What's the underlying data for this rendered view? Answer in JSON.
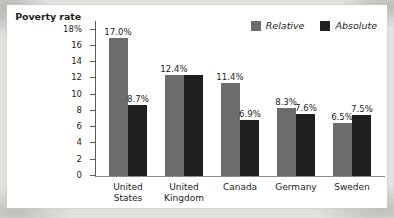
{
  "axis_title": {
    "line1": "Poverty",
    "line2": "rate"
  },
  "legend": {
    "relative": {
      "label": "Relative",
      "color": "#6c6c6c",
      "swatch": "relative-swatch"
    },
    "absolute": {
      "label": "Absolute",
      "color": "#1f1f1f",
      "swatch": "absolute-swatch"
    }
  },
  "y_ticks": [
    "18%",
    "16",
    "14",
    "12",
    "10",
    "8",
    "6",
    "4",
    "2",
    "0"
  ],
  "labels": {
    "us": {
      "relative": "17.0%",
      "absolute": "8.7%",
      "l1": "United",
      "l2": "States"
    },
    "uk": {
      "relative": "12.4%",
      "absolute": "",
      "l1": "United",
      "l2": "Kingdom"
    },
    "canada": {
      "relative": "11.4%",
      "absolute": "6.9%",
      "l1": "Canada",
      "l2": ""
    },
    "germany": {
      "relative": "8.3%",
      "absolute": "7.6%",
      "l1": "Germany",
      "l2": ""
    },
    "sweden": {
      "relative": "6.5%",
      "absolute": "7.5%",
      "l1": "Sweden",
      "l2": ""
    }
  },
  "chart_data": {
    "type": "bar",
    "title": "",
    "xlabel": "",
    "ylabel": "Poverty rate",
    "ylim": [
      0,
      18
    ],
    "ytick_values": [
      0,
      2,
      4,
      6,
      8,
      10,
      12,
      14,
      16,
      18
    ],
    "ytick_labels": [
      "0",
      "2",
      "4",
      "6",
      "8",
      "10",
      "12",
      "14",
      "16",
      "18%"
    ],
    "grid": false,
    "legend_position": "top-right",
    "categories": [
      "United States",
      "United Kingdom",
      "Canada",
      "Germany",
      "Sweden"
    ],
    "series": [
      {
        "name": "Relative",
        "color": "#6c6c6c",
        "values": [
          17.0,
          12.4,
          11.4,
          8.3,
          6.5
        ]
      },
      {
        "name": "Absolute",
        "color": "#1f1f1f",
        "values": [
          8.7,
          12.4,
          6.9,
          7.6,
          7.5
        ]
      }
    ],
    "data_labels": [
      [
        "17.0%",
        "12.4%",
        "11.4%",
        "8.3%",
        "6.5%"
      ],
      [
        "8.7%",
        "",
        "6.9%",
        "7.6%",
        "7.5%"
      ]
    ]
  }
}
